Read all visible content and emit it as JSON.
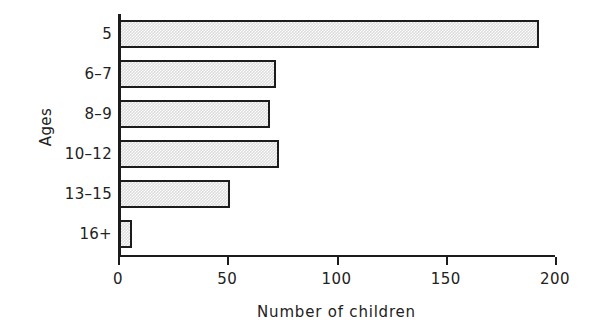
{
  "chart_data": {
    "type": "bar",
    "orientation": "horizontal",
    "title": "",
    "xlabel": "Number of children",
    "ylabel": "Ages",
    "categories": [
      "5",
      "6–7",
      "8–9",
      "10–12",
      "13–15",
      "16+"
    ],
    "values": [
      192,
      72,
      69,
      73,
      51,
      6
    ],
    "xlim": [
      0,
      200
    ],
    "xticks": [
      0,
      50,
      100,
      150,
      200
    ],
    "xtick_labels": [
      "0",
      "50",
      "100",
      "150",
      "200"
    ],
    "grid": false,
    "legend": false,
    "bar_fill_color": "#dcdcdc",
    "bar_edge_color": "#1c1c1c",
    "axis_color": "#1c1c1c",
    "background_color": "#ffffff"
  }
}
